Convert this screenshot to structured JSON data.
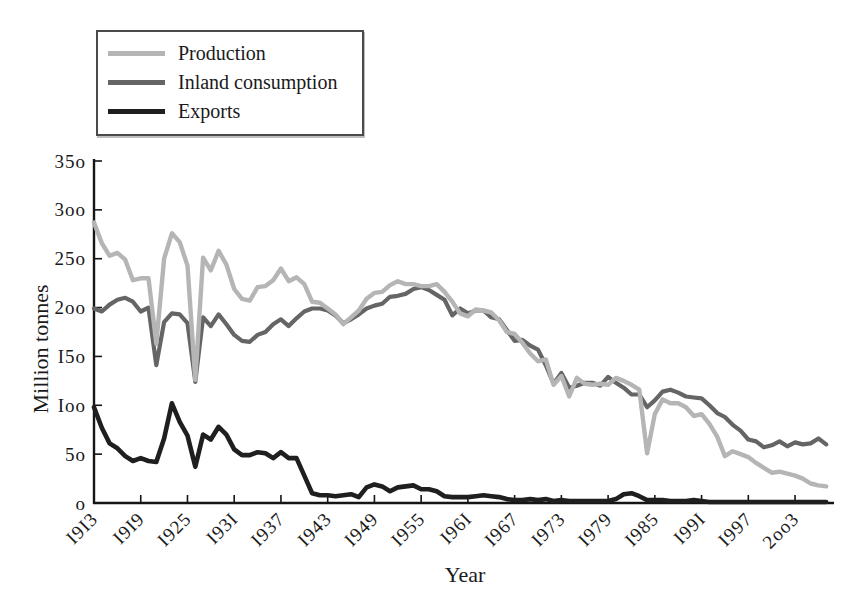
{
  "figure": {
    "background": "#ffffff",
    "text_color": "#1a1a1a",
    "axis_color": "#151515"
  },
  "legend": {
    "position": "top-left",
    "items": [
      {
        "label": "Production",
        "color": "#b5b5b5"
      },
      {
        "label": "Inland consumption",
        "color": "#656565"
      },
      {
        "label": "Exports",
        "color": "#1f1f1f"
      }
    ]
  },
  "chart_data": {
    "type": "line",
    "title": "",
    "xlabel": "Year",
    "ylabel": "Million tonnes",
    "xlim": [
      1913,
      2008
    ],
    "ylim": [
      0,
      350
    ],
    "grid": false,
    "x_ticks": [
      1913,
      1919,
      1925,
      1931,
      1937,
      1943,
      1949,
      1955,
      1961,
      1967,
      1973,
      1979,
      1985,
      1991,
      1997,
      2003
    ],
    "y_ticks": [
      0,
      50,
      100,
      150,
      200,
      250,
      300,
      350
    ],
    "tick_label_style": "old-style numerals, x labels rotated 45 degrees",
    "x": [
      1913,
      1914,
      1915,
      1916,
      1917,
      1918,
      1919,
      1920,
      1921,
      1922,
      1923,
      1924,
      1925,
      1926,
      1927,
      1928,
      1929,
      1930,
      1931,
      1932,
      1933,
      1934,
      1935,
      1936,
      1937,
      1938,
      1939,
      1940,
      1941,
      1942,
      1943,
      1944,
      1945,
      1946,
      1947,
      1948,
      1949,
      1950,
      1951,
      1952,
      1953,
      1954,
      1955,
      1956,
      1957,
      1958,
      1959,
      1960,
      1961,
      1962,
      1963,
      1964,
      1965,
      1966,
      1967,
      1968,
      1969,
      1970,
      1971,
      1972,
      1973,
      1974,
      1975,
      1976,
      1977,
      1978,
      1979,
      1980,
      1981,
      1982,
      1983,
      1984,
      1985,
      1986,
      1987,
      1988,
      1989,
      1990,
      1991,
      1992,
      1993,
      1994,
      1995,
      1996,
      1997,
      1998,
      1999,
      2000,
      2001,
      2002,
      2003,
      2004,
      2005,
      2006,
      2007
    ],
    "series": [
      {
        "name": "Production",
        "color": "#b5b5b5",
        "values": [
          287,
          266,
          253,
          256,
          249,
          228,
          230,
          230,
          163,
          250,
          276,
          267,
          243,
          126,
          251,
          238,
          258,
          244,
          219,
          209,
          207,
          221,
          222,
          228,
          240,
          227,
          231,
          224,
          206,
          205,
          199,
          193,
          183,
          190,
          197,
          209,
          215,
          216,
          223,
          227,
          224,
          224,
          222,
          222,
          224,
          216,
          206,
          194,
          191,
          198,
          197,
          195,
          187,
          175,
          173,
          164,
          153,
          145,
          147,
          121,
          130,
          109,
          128,
          122,
          121,
          122,
          121,
          128,
          125,
          121,
          116,
          51,
          91,
          106,
          102,
          102,
          98,
          89,
          91,
          81,
          68,
          48,
          53,
          50,
          47,
          41,
          36,
          31,
          32,
          30,
          28,
          25,
          20,
          18,
          17
        ]
      },
      {
        "name": "Inland consumption",
        "color": "#656565",
        "values": [
          199,
          196,
          203,
          208,
          210,
          206,
          196,
          200,
          141,
          185,
          194,
          193,
          184,
          124,
          190,
          181,
          193,
          183,
          172,
          166,
          165,
          172,
          175,
          183,
          188,
          181,
          189,
          196,
          199,
          199,
          197,
          192,
          184,
          188,
          193,
          199,
          202,
          204,
          211,
          212,
          214,
          219,
          221,
          218,
          213,
          208,
          192,
          199,
          194,
          197,
          197,
          190,
          188,
          177,
          166,
          167,
          161,
          157,
          141,
          122,
          133,
          118,
          120,
          123,
          123,
          120,
          129,
          123,
          118,
          111,
          111,
          98,
          105,
          114,
          116,
          113,
          109,
          108,
          107,
          100,
          92,
          88,
          80,
          74,
          65,
          63,
          57,
          59,
          63,
          58,
          62,
          60,
          61,
          66,
          60
        ]
      },
      {
        "name": "Exports",
        "color": "#1f1f1f",
        "values": [
          98,
          77,
          61,
          56,
          48,
          43,
          46,
          43,
          42,
          66,
          102,
          83,
          69,
          37,
          70,
          65,
          78,
          70,
          55,
          49,
          49,
          52,
          51,
          46,
          52,
          46,
          46,
          28,
          10,
          8,
          8,
          7,
          8,
          9,
          6,
          16,
          19,
          17,
          12,
          16,
          17,
          18,
          14,
          14,
          12,
          7,
          6,
          6,
          6,
          7,
          8,
          7,
          6,
          4,
          3,
          3,
          4,
          3,
          4,
          2,
          3,
          2,
          2,
          2,
          2,
          2,
          2,
          4,
          9,
          10,
          7,
          3,
          3,
          3,
          2,
          2,
          2,
          3,
          2,
          1,
          1,
          1,
          1,
          1,
          1,
          1,
          1,
          1,
          1,
          1,
          1,
          1,
          1,
          1,
          1
        ]
      }
    ]
  }
}
